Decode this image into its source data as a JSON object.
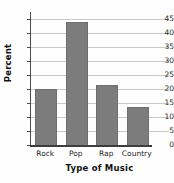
{
  "chart_data": {
    "type": "bar",
    "title": "",
    "title_note": "title cut off at top of image",
    "categories": [
      "Rock",
      "Pop",
      "Rap",
      "Country"
    ],
    "values": [
      20,
      44,
      21.5,
      13.5
    ],
    "xlabel": "Type of Music",
    "ylabel": "Percent",
    "ylim": [
      0,
      47.5
    ],
    "ytick_values": [
      0,
      5,
      10,
      15,
      20,
      25,
      30,
      35,
      40,
      45
    ],
    "ytick_labels": [
      "0",
      "5",
      "10",
      "15",
      "20",
      "25",
      "30",
      "35",
      "40",
      "45"
    ],
    "grid": true,
    "grid_axis": "y",
    "legend": false,
    "bar_color": "#7c7c7c",
    "gridline_color": "#c9c9c9",
    "axis_color": "#3d3d3d",
    "background_color": "#fefefe"
  },
  "axes": {
    "y_title": "Percent",
    "x_title": "Type of Music"
  }
}
